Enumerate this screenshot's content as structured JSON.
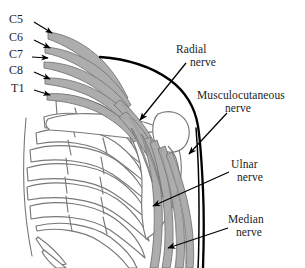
{
  "figure": {
    "background_color": "#ffffff",
    "bone_stroke_color": "#777777",
    "nerve_fill_color": "#a8a8a8",
    "nerve_stroke_color": "#6e6e6e",
    "leader_line_color": "#000000",
    "contour_color": "#000000"
  },
  "nerve_roots": {
    "group_name": "cervical-and-thoracic-nerve-roots",
    "items": [
      {
        "id": "c5",
        "label": "C5"
      },
      {
        "id": "c6",
        "label": "C6"
      },
      {
        "id": "c7",
        "label": "C7"
      },
      {
        "id": "c8",
        "label": "C8"
      },
      {
        "id": "t1",
        "label": "T1"
      }
    ]
  },
  "nerve_labels": {
    "radial": {
      "line1": "Radial",
      "line2": "nerve"
    },
    "musculocutaneous": {
      "line1": "Musculocutaneous",
      "line2": "nerve"
    },
    "ulnar": {
      "line1": "Ulnar",
      "line2": "nerve"
    },
    "median": {
      "line1": "Median",
      "line2": "nerve"
    }
  },
  "structures": {
    "rib_cage": "rib-cage",
    "clavicle": "clavicle",
    "scapula": "scapula",
    "humerus_head": "humeral-head",
    "arm_contour": "arm-body-contour",
    "plexus_trunks": "brachial-plexus-trunks"
  }
}
